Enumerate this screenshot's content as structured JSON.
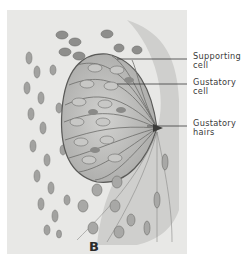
{
  "figure": {
    "panel_label": "B",
    "colors": {
      "background": "#ffffff",
      "panel_fill": "#e6e6e4",
      "tissue_dark": "#5e5e5e",
      "cell_fill": "#bdbdbb",
      "nucleus": "#8a8a88",
      "label_text": "#3a3a3a"
    }
  },
  "labels": [
    {
      "id": "supporting-cell",
      "line1": "Supporting",
      "line2": "cell",
      "leader_y": 59
    },
    {
      "id": "gustatory-cell",
      "line1": "Gustatory",
      "line2": "cell",
      "leader_y": 84
    },
    {
      "id": "gustatory-hairs",
      "line1": "Gustatory",
      "line2": "hairs",
      "leader_y": 126
    }
  ]
}
